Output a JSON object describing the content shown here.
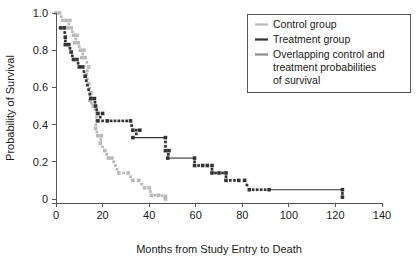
{
  "chart_data": {
    "type": "line",
    "title": "",
    "xlabel": "Months from Study Entry to Death",
    "ylabel": "Probability of Survival",
    "xlim": [
      0,
      140
    ],
    "ylim": [
      0,
      1.0
    ],
    "xticks": [
      "0",
      "20",
      "40",
      "60",
      "80",
      "100",
      "120",
      "140"
    ],
    "xtick_values": [
      0,
      20,
      40,
      60,
      80,
      100,
      120,
      140
    ],
    "yticks": [
      "1.0",
      "0.8",
      "0.6",
      "0.4",
      "0.2",
      "0"
    ],
    "ytick_values": [
      1.0,
      0.8,
      0.6,
      0.4,
      0.2,
      0
    ],
    "grid": false,
    "marker_style": "dotted-square",
    "legend_position": "top-right",
    "colors": {
      "control": "#b9b9b9",
      "treatment": "#333333",
      "overlapping": "#8d8d8d",
      "axis": "#555555",
      "background": "#ffffff"
    },
    "series": [
      {
        "name": "Control group",
        "color_key": "control",
        "points": [
          [
            0,
            1.0
          ],
          [
            1.5,
            1.0
          ],
          [
            3,
            0.96
          ],
          [
            4.5,
            0.96
          ],
          [
            6,
            0.96
          ],
          [
            5,
            0.92
          ],
          [
            6.5,
            0.92
          ],
          [
            7.5,
            0.88
          ],
          [
            9,
            0.88
          ],
          [
            8,
            0.84
          ],
          [
            9.5,
            0.84
          ],
          [
            10.5,
            0.8
          ],
          [
            12,
            0.8
          ],
          [
            11,
            0.76
          ],
          [
            12.5,
            0.76
          ],
          [
            14,
            0.71
          ],
          [
            13,
            0.67
          ],
          [
            14,
            0.62
          ],
          [
            15,
            0.57
          ],
          [
            14.5,
            0.53
          ],
          [
            16,
            0.5
          ],
          [
            17.5,
            0.46
          ],
          [
            17,
            0.38
          ],
          [
            18,
            0.34
          ],
          [
            19.5,
            0.34
          ],
          [
            19,
            0.3
          ],
          [
            21,
            0.26
          ],
          [
            22.5,
            0.22
          ],
          [
            24,
            0.22
          ],
          [
            27,
            0.14
          ],
          [
            31,
            0.14
          ],
          [
            33,
            0.1
          ],
          [
            35.5,
            0.1
          ],
          [
            38,
            0.06
          ],
          [
            40,
            0.06
          ],
          [
            41,
            0.02
          ],
          [
            44,
            0.02
          ],
          [
            47,
            0.015
          ],
          [
            47,
            0.0
          ]
        ]
      },
      {
        "name": "Treatment group",
        "color_key": "treatment",
        "points": [
          [
            2,
            0.92
          ],
          [
            3.5,
            0.92
          ],
          [
            4,
            0.87
          ],
          [
            4,
            0.83
          ],
          [
            5.5,
            0.83
          ],
          [
            6.5,
            0.79
          ],
          [
            7.5,
            0.75
          ],
          [
            9,
            0.75
          ],
          [
            10,
            0.71
          ],
          [
            11.5,
            0.71
          ],
          [
            12.5,
            0.66
          ],
          [
            15,
            0.54
          ],
          [
            16.5,
            0.54
          ],
          [
            17,
            0.5
          ],
          [
            18,
            0.46
          ],
          [
            20,
            0.46
          ],
          [
            18,
            0.42
          ],
          [
            22,
            0.42
          ],
          [
            32,
            0.42
          ],
          [
            33,
            0.37
          ],
          [
            36,
            0.37
          ],
          [
            33,
            0.33
          ],
          [
            47,
            0.33
          ],
          [
            47,
            0.26
          ],
          [
            48.5,
            0.26
          ],
          [
            48,
            0.22
          ],
          [
            59.5,
            0.22
          ],
          [
            59.5,
            0.18
          ],
          [
            63,
            0.18
          ],
          [
            65,
            0.18
          ],
          [
            67,
            0.18
          ],
          [
            67,
            0.14
          ],
          [
            70,
            0.14
          ],
          [
            73,
            0.14
          ],
          [
            73,
            0.1
          ],
          [
            78.5,
            0.1
          ],
          [
            81,
            0.1
          ],
          [
            83,
            0.05
          ],
          [
            91.5,
            0.05
          ],
          [
            123,
            0.05
          ],
          [
            123,
            0.01
          ]
        ]
      }
    ],
    "legend": [
      {
        "label": "Control group",
        "color_key": "control",
        "lines": [
          "Control group"
        ]
      },
      {
        "label": "Treatment group",
        "color_key": "treatment",
        "lines": [
          "Treatment group"
        ]
      },
      {
        "label": "Overlapping control and treatment probabilities of survival",
        "color_key": "overlapping",
        "lines": [
          "Overlapping control and",
          "treatment probabilities",
          "of survival"
        ]
      }
    ]
  }
}
